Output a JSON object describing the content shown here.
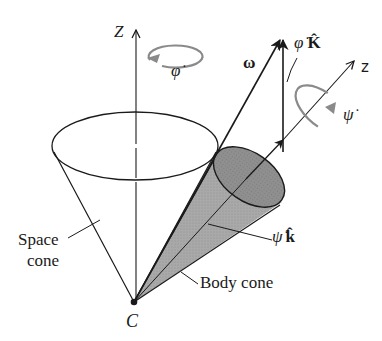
{
  "diagram": {
    "type": "torque-free precession of a rigid body (space cone and body cone)",
    "labels": {
      "space_axis": "Z",
      "phi_dot": "φ̇",
      "omega": "ω",
      "phi_dot_K": "φ̇ K̂",
      "phi_dot_K_sym": "φ̇",
      "phi_dot_K_vec": "K̂",
      "body_axis": "z",
      "psi_dot": "ψ̇",
      "psi_dot_k_sym": "ψ̇",
      "psi_dot_k_vec": "k̂",
      "space_cone_line1": "Space",
      "space_cone_line2": "cone",
      "body_cone": "Body cone",
      "apex": "C"
    },
    "colors": {
      "line": "#1a1a1a",
      "body_cone_fill": "#a8a8a8",
      "body_cone_end_fill": "#8e8e8e",
      "rotation_arrow": "#8a8a8a",
      "background": "#ffffff"
    },
    "nodes": [
      {
        "id": "C",
        "label": "C",
        "role": "fixed point / common apex"
      },
      {
        "id": "space_cone",
        "label": "Space cone"
      },
      {
        "id": "body_cone",
        "label": "Body cone"
      }
    ],
    "vectors": [
      {
        "id": "Z",
        "label": "Z",
        "from": "C",
        "direction": "vertical"
      },
      {
        "id": "omega",
        "label": "ω",
        "from": "C",
        "note": "along line of contact of cones"
      },
      {
        "id": "phiK",
        "label": "φ̇ K̂",
        "direction": "parallel to Z"
      },
      {
        "id": "z",
        "label": "z",
        "from": "C",
        "note": "body symmetry axis"
      },
      {
        "id": "psik",
        "label": "ψ̇ k̂",
        "direction": "along z"
      }
    ],
    "rotations": [
      {
        "label": "φ̇",
        "about": "Z"
      },
      {
        "label": "ψ̇",
        "about": "z"
      }
    ]
  }
}
